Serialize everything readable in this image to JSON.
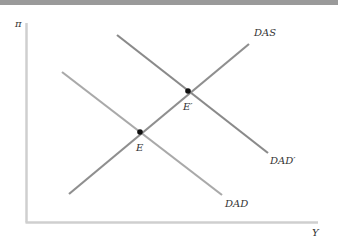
{
  "diagram": {
    "type": "economics AD-AS diagram",
    "axes": {
      "y_label": "π",
      "x_label": "Y"
    },
    "curves": [
      {
        "name": "DAS",
        "label": "DAS",
        "slope": "upward",
        "x1": 69,
        "y1": 194,
        "x2": 249,
        "y2": 44,
        "color": "#8f8f8f"
      },
      {
        "name": "DAD",
        "label": "DAD",
        "slope": "downward",
        "x1": 62,
        "y1": 72,
        "x2": 222,
        "y2": 195,
        "color": "#a8a8a8"
      },
      {
        "name": "DAD_prime",
        "label": "DAD′",
        "slope": "downward",
        "x1": 117,
        "y1": 35,
        "x2": 268,
        "y2": 153,
        "color": "#8a8a8a"
      }
    ],
    "points": [
      {
        "name": "E",
        "label": "E",
        "x": 140,
        "y": 132
      },
      {
        "name": "E_prime",
        "label": "E′",
        "x": 188,
        "y": 91
      }
    ],
    "colors": {
      "axis": "#cccccc",
      "topbar": "#9a9a9a",
      "point": "#111111",
      "text": "#333333"
    }
  },
  "labels": {
    "pi": "π",
    "y": "Y",
    "das": "DAS",
    "dad": "DAD",
    "dad_prime": "DAD′",
    "e": "E",
    "e_prime": "E′"
  }
}
